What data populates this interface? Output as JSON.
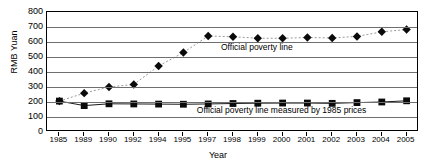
{
  "chart_data": {
    "type": "line",
    "title": "",
    "xlabel": "Year",
    "ylabel": "RMB Yuan",
    "ylim": [
      0,
      800
    ],
    "ytick_step": 100,
    "yticks": [
      800,
      700,
      600,
      500,
      400,
      300,
      200,
      100,
      0
    ],
    "grid": true,
    "legend_position": "none",
    "categories": [
      "1985",
      "1989",
      "1990",
      "1992",
      "1994",
      "1995",
      "1997",
      "1998",
      "1999",
      "2000",
      "2001",
      "2002",
      "2003",
      "2004",
      "2005"
    ],
    "series": [
      {
        "name": "Official poverty line",
        "marker": "diamond",
        "line_style": "dotted",
        "values": [
          206,
          259,
          300,
          317,
          440,
          530,
          640,
          635,
          625,
          625,
          630,
          627,
          637,
          668,
          683
        ]
      },
      {
        "name": "Official poverty line measured by 1985 prices",
        "marker": "square",
        "line_style": "solid",
        "values": [
          206,
          176,
          188,
          187,
          186,
          185,
          187,
          190,
          192,
          193,
          193,
          191,
          196,
          200,
          208
        ]
      }
    ],
    "annotations": [
      {
        "text": "Official poverty line",
        "x_category": "1999",
        "y_value": 560
      },
      {
        "text": "Official poverty line measured by 1985 prices",
        "x_category": "2000",
        "y_value": 140
      }
    ]
  },
  "axes": {
    "y_title": "RMB Yuan",
    "x_title": "Year",
    "y_tick_labels": [
      "800",
      "700",
      "600",
      "500",
      "400",
      "300",
      "200",
      "100",
      "0"
    ],
    "x_tick_labels": [
      "1985",
      "1989",
      "1990",
      "1992",
      "1994",
      "1995",
      "1997",
      "1998",
      "1999",
      "2000",
      "2001",
      "2002",
      "2003",
      "2004",
      "2005"
    ]
  },
  "annotations": {
    "official_poverty_line": "Official poverty line",
    "official_poverty_line_1985": "Official poverty line measured by 1985 prices"
  },
  "colors": {
    "marker": "#0a0a0a",
    "grid": "#6f6f6f",
    "frame": "#000000",
    "dotted_line": "#9a9a9a",
    "solid_line": "#1a1a1a",
    "background": "#ffffff"
  }
}
